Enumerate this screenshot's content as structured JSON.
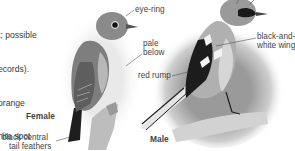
{
  "body_text": {
    "lines": [
      "t; possible",
      "ecords).",
      "orange",
      "hite spot",
      "arangey",
      "nges to"
    ]
  },
  "figures": {
    "female": {
      "caption": "Female",
      "callouts": {
        "eye_ring": "eye-ring",
        "pale_below_1": "pale",
        "pale_below_2": "below",
        "tail_1": "black central",
        "tail_2": "tail feathers"
      }
    },
    "male": {
      "caption": "Male",
      "callouts": {
        "red_rump": "red rump",
        "wing_1": "black-and-",
        "wing_2": "white wing"
      }
    }
  }
}
